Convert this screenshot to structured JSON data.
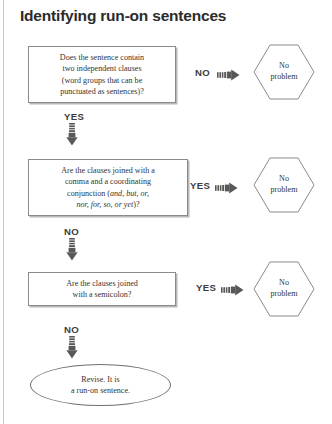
{
  "title": "Identifying run-on sentences",
  "colors": {
    "box_border": "#8b8b8b",
    "box_shadow": "#b8b8b8",
    "hex_border": "#8b8b8b",
    "oval_border": "#6f6f6f",
    "text": "#333333",
    "title": "#2b2b2b",
    "arrow": "#555555",
    "page_rule": "#c9c9c9"
  },
  "nodes": {
    "box1": {
      "line1": "Does the sentence contain",
      "line2": "two independent clauses",
      "line3": "(word groups that can be",
      "line4": "punctuated as sentences)?"
    },
    "box2": {
      "line1": "Are the clauses joined with a",
      "line2": "comma and a coordinating",
      "line3_pre": "conjunction (",
      "line3_italic": "and, but, or,",
      "line4_italic": "nor, for, so, or yet",
      "line4_post": ")?"
    },
    "box3": {
      "line1": "Are the clauses joined",
      "line2": "with a semicolon?"
    },
    "hex1": {
      "line1": "No",
      "line2": "problem"
    },
    "hex2": {
      "line1": "No",
      "line2": "problem"
    },
    "hex3": {
      "line1": "No",
      "line2": "problem"
    },
    "oval": {
      "line1": "Revise. It is",
      "line2": "a run-on sentence."
    }
  },
  "branches": {
    "row1_right": "NO",
    "row2_right": "YES",
    "row3_right": "YES",
    "down1": "YES",
    "down2": "NO",
    "down3": "NO"
  },
  "icons": {
    "arrow_right": "striped-right-arrow-icon",
    "arrow_down": "striped-down-arrow-icon"
  },
  "flow": {
    "type": "flowchart",
    "steps": [
      {
        "id": "box1",
        "kind": "decision",
        "yes_to": "box2",
        "no_to": "hex1"
      },
      {
        "id": "box2",
        "kind": "decision",
        "yes_to": "hex2",
        "no_to": "box3"
      },
      {
        "id": "box3",
        "kind": "decision",
        "yes_to": "hex3",
        "no_to": "oval"
      },
      {
        "id": "oval",
        "kind": "terminator"
      }
    ]
  }
}
